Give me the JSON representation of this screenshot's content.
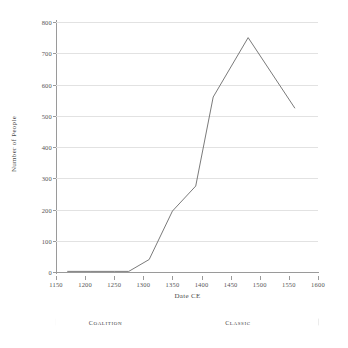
{
  "chart_data": {
    "type": "line",
    "title": "",
    "xlabel": "Date CE",
    "ylabel": "Number of People",
    "xlim": [
      1150,
      1600
    ],
    "ylim": [
      0,
      800
    ],
    "xticks": [
      1150,
      1200,
      1250,
      1300,
      1350,
      1400,
      1450,
      1500,
      1550,
      1600
    ],
    "yticks": [
      0,
      100,
      200,
      300,
      400,
      500,
      600,
      700,
      800
    ],
    "grid": "horizontal",
    "legend": "none",
    "series": [
      {
        "name": "Number of People",
        "color": "#6b6b6b",
        "x": [
          1170,
          1210,
          1250,
          1275,
          1310,
          1350,
          1390,
          1420,
          1480,
          1560
        ],
        "values": [
          2,
          2,
          2,
          2,
          40,
          195,
          275,
          560,
          750,
          525
        ]
      }
    ],
    "annotations": [
      {
        "label": "Coalition",
        "x_start": 1150,
        "x_end": 1320
      },
      {
        "label": "Classic",
        "x_start": 1325,
        "x_end": 1600
      }
    ]
  },
  "axes": {
    "x_title": "Date CE",
    "y_title": "Number of People"
  }
}
